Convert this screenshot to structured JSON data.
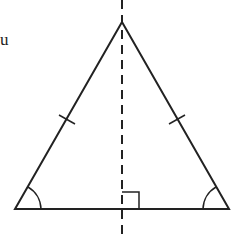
{
  "diagram": {
    "type": "isosceles-triangle-symmetry",
    "partial_label": "u",
    "stroke_color": "#222222",
    "apex": [
      122,
      22
    ],
    "base_left": [
      15,
      209
    ],
    "base_right": [
      229,
      209
    ],
    "axis_of_symmetry": {
      "x": 122,
      "style": "dashed"
    },
    "marks": [
      "equal-side tick left",
      "equal-side tick right",
      "equal base angles",
      "right angle at base midpoint"
    ]
  }
}
